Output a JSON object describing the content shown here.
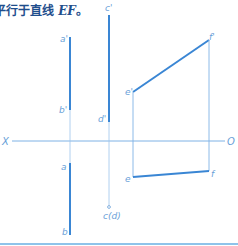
{
  "caption": {
    "prefix": "平行于直线 ",
    "line_name": "EF",
    "suffix": "。"
  },
  "colors": {
    "caption": "#1f4e8c",
    "thick_line": "#3a86d4",
    "thin_line": "#7fb2e5",
    "label": "#6a9fd8",
    "bottom_rule": "#8ec3ea"
  },
  "axis": {
    "left_label": "X",
    "right_label": "O"
  },
  "labels": {
    "a_prime": "a'",
    "b_prime": "b'",
    "c_prime": "c'",
    "d_prime": "d'",
    "e_prime": "e'",
    "f_prime": "f'",
    "a": "a",
    "b": "b",
    "e": "e",
    "f": "f",
    "cd": "c(d)"
  }
}
